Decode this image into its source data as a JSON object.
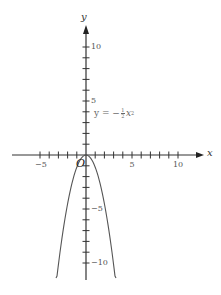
{
  "chart_data": {
    "type": "line",
    "title": "",
    "xlabel": "x",
    "ylabel": "y",
    "origin_label": "O",
    "xlim": [
      -8,
      12
    ],
    "ylim": [
      -11.3,
      12.5
    ],
    "x_ticks": [
      -5,
      -4,
      -3,
      -2,
      -1,
      1,
      2,
      3,
      4,
      5,
      6,
      7,
      8,
      9,
      10
    ],
    "x_tick_labels": [
      {
        "value": -5,
        "label": "−5"
      },
      {
        "value": 5,
        "label": "5"
      },
      {
        "value": 10,
        "label": "10"
      }
    ],
    "y_ticks": [
      -10,
      -9,
      -8,
      -7,
      -6,
      -5,
      -4,
      -3,
      -2,
      -1,
      1,
      2,
      3,
      4,
      5,
      6,
      7,
      8,
      9,
      10
    ],
    "y_tick_labels": [
      {
        "value": 10,
        "label": "10"
      },
      {
        "value": 5,
        "label": "5"
      },
      {
        "value": -5,
        "label": "−5"
      },
      {
        "value": -10,
        "label": "−10"
      }
    ],
    "grid": false,
    "legend": "none",
    "series": [
      {
        "name": "y = −½x²",
        "equation": "y = -(1/2)x^2",
        "x": [
          -3.1,
          -2,
          -1,
          0,
          1,
          2,
          3.1
        ],
        "values": [
          -11.3,
          -4.7,
          -1.2,
          0,
          -1.2,
          -4.7,
          -11.3
        ]
      }
    ],
    "annotations": [
      {
        "text_prefix": "y = −",
        "fraction_num": "1",
        "fraction_den": "2",
        "text_suffix": "x",
        "exponent": "2",
        "position": {
          "x": 1,
          "y": 4
        }
      }
    ],
    "colors": {
      "axis": "#333333",
      "curve": "#555555",
      "text": "#555555"
    }
  }
}
